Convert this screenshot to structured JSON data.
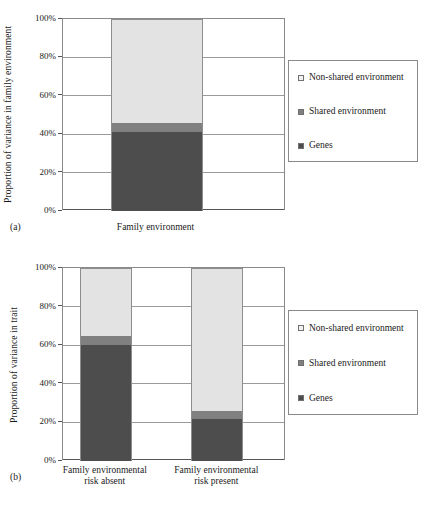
{
  "colors": {
    "non_shared": "#e3e3e3",
    "shared": "#808080",
    "genes": "#4d4d4d",
    "frame": "#8a8a8a",
    "grid": "#9a9a9a",
    "text": "#1a1a1a"
  },
  "legend": {
    "entries": [
      {
        "label": "Non-shared environment",
        "swatch": "#f2f2f2"
      },
      {
        "label": "Shared environment",
        "swatch": "#808080"
      },
      {
        "label": "Genes",
        "swatch": "#4d4d4d"
      }
    ]
  },
  "panel_a": {
    "letter": "(a)",
    "ylabel": "Proportion of variance in family environment",
    "yticks": [
      "100%",
      "80%",
      "60%",
      "40%",
      "20%",
      "0%"
    ],
    "xlabel": "Family environment",
    "legend_entries": [
      {
        "label": "Non-shared environment",
        "swatch": "#f2f2f2"
      },
      {
        "label": "Shared environment",
        "swatch": "#808080"
      },
      {
        "label": "Genes",
        "swatch": "#4d4d4d"
      }
    ]
  },
  "panel_b": {
    "letter": "(b)",
    "ylabel": "Proportion of variance in trait",
    "yticks": [
      "100%",
      "80%",
      "60%",
      "40%",
      "20%",
      "0%"
    ],
    "xlabels": [
      "Family environmental\nrisk absent",
      "Family environmental\nrisk present"
    ],
    "legend_entries": [
      {
        "label": "Non-shared environment",
        "swatch": "#f2f2f2"
      },
      {
        "label": "Shared environment",
        "swatch": "#808080"
      },
      {
        "label": "Genes",
        "swatch": "#4d4d4d"
      }
    ]
  },
  "chart_data": [
    {
      "type": "bar",
      "panel": "(a)",
      "stacked": true,
      "percent": true,
      "title": "",
      "xlabel": "",
      "ylabel": "Proportion of variance in family environment",
      "categories": [
        "Family environment"
      ],
      "ylim": [
        0,
        100
      ],
      "yticks": [
        0,
        20,
        40,
        60,
        80,
        100
      ],
      "ytick_labels": [
        "0%",
        "20%",
        "40%",
        "60%",
        "80%",
        "100%"
      ],
      "grid": true,
      "legend_position": "right-outside",
      "series": [
        {
          "name": "Genes",
          "values": [
            41
          ],
          "color": "#4d4d4d"
        },
        {
          "name": "Shared environment",
          "values": [
            5
          ],
          "color": "#808080"
        },
        {
          "name": "Non-shared environment",
          "values": [
            54
          ],
          "color": "#e3e3e3"
        }
      ]
    },
    {
      "type": "bar",
      "panel": "(b)",
      "stacked": true,
      "percent": true,
      "title": "",
      "xlabel": "",
      "ylabel": "Proportion of variance in trait",
      "categories": [
        "Family environmental risk absent",
        "Family environmental risk present"
      ],
      "ylim": [
        0,
        100
      ],
      "yticks": [
        0,
        20,
        40,
        60,
        80,
        100
      ],
      "ytick_labels": [
        "0%",
        "20%",
        "40%",
        "60%",
        "80%",
        "100%"
      ],
      "grid": true,
      "legend_position": "right-outside",
      "series": [
        {
          "name": "Genes",
          "values": [
            60,
            22
          ],
          "color": "#4d4d4d"
        },
        {
          "name": "Shared environment",
          "values": [
            5,
            4
          ],
          "color": "#808080"
        },
        {
          "name": "Non-shared environment",
          "values": [
            35,
            74
          ],
          "color": "#e3e3e3"
        }
      ]
    }
  ]
}
